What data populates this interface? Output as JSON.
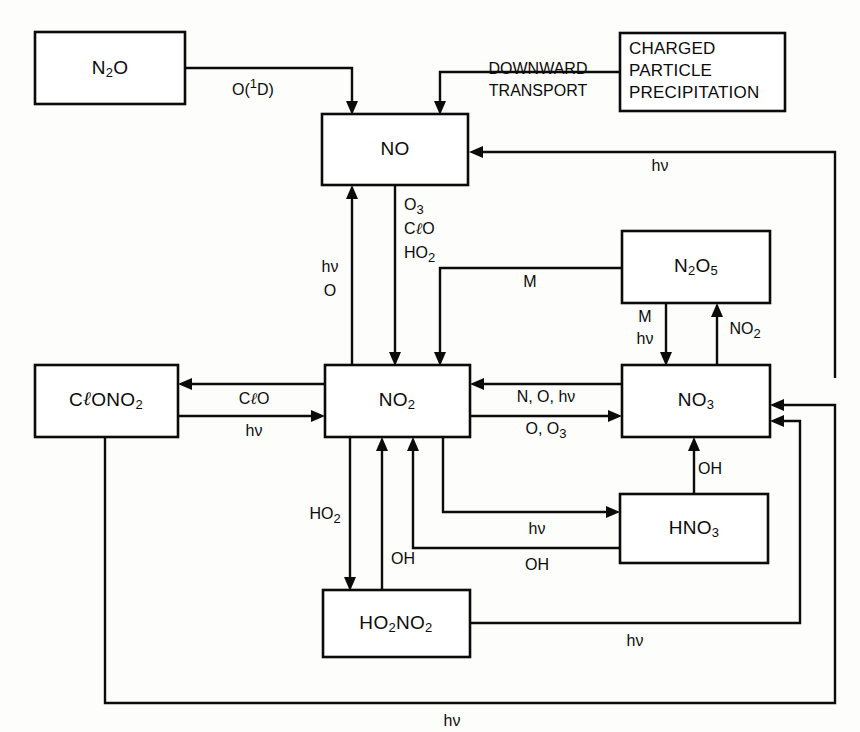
{
  "figure": {
    "background_color": "#fdfdfb",
    "line_color": "#0b0b0b"
  },
  "boxes": [
    {
      "id": "n2o",
      "label": "N2O",
      "display": [
        "N",
        "2",
        "O"
      ],
      "x": 35,
      "y": 32,
      "w": 150,
      "h": 72
    },
    {
      "id": "cpp",
      "label": "CHARGED PARTICLE PRECIPITATION",
      "lines": [
        "CHARGED",
        "PARTICLE",
        "PRECIPITATION"
      ],
      "x": 620,
      "y": 33,
      "w": 165,
      "h": 78
    },
    {
      "id": "no",
      "label": "NO",
      "display": [
        "NO"
      ],
      "x": 322,
      "y": 114,
      "w": 146,
      "h": 71
    },
    {
      "id": "n2o5",
      "label": "N2O5",
      "display": [
        "N",
        "2",
        "O",
        "5"
      ],
      "x": 622,
      "y": 231,
      "w": 148,
      "h": 72
    },
    {
      "id": "clono2",
      "label": "CℓONO2",
      "display": [
        "Cℓ",
        "ONO",
        "2"
      ],
      "x": 35,
      "y": 365,
      "w": 143,
      "h": 72
    },
    {
      "id": "no2",
      "label": "NO2",
      "display": [
        "NO",
        "2"
      ],
      "x": 325,
      "y": 365,
      "w": 145,
      "h": 72
    },
    {
      "id": "no3",
      "label": "NO3",
      "display": [
        "NO",
        "3"
      ],
      "x": 622,
      "y": 365,
      "w": 148,
      "h": 72
    },
    {
      "id": "hno3",
      "label": "HNO3",
      "display": [
        "HNO",
        "3"
      ],
      "x": 620,
      "y": 494,
      "w": 148,
      "h": 69
    },
    {
      "id": "ho2no2",
      "label": "HO2NO2",
      "display": [
        "HO",
        "2",
        "NO",
        "2"
      ],
      "x": 323,
      "y": 590,
      "w": 147,
      "h": 67
    }
  ],
  "edge_labels": {
    "o1d": "O(1D)",
    "downward_transport_line1": "DOWNWARD",
    "downward_transport_line2": "TRANSPORT",
    "hv_no_right": "hν",
    "o3": "O3",
    "clo_mid": "CℓO",
    "ho2_mid": "HO2",
    "hv_left": "hν",
    "o_left": "O",
    "m_n2o5": "M",
    "m_down": "M",
    "hv_down": "hν",
    "no2_up": "NO2",
    "clo_left": "CℓO",
    "hv_clono2": "hν",
    "n_o_hv": "N, O, hν",
    "o_o3": "O, O3",
    "ho2_lower": "HO2",
    "oh_ho2no2": "OH",
    "hv_hno3": "hν",
    "oh_hno3": "OH",
    "oh_no3": "OH",
    "hv_ho2no2_right": "hν",
    "hv_bottom": "hν"
  },
  "species": [
    "N2O",
    "NO",
    "NO2",
    "NO3",
    "N2O5",
    "HNO3",
    "HO2NO2",
    "CℓONO2"
  ],
  "sources": [
    "CHARGED PARTICLE PRECIPITATION",
    "DOWNWARD TRANSPORT",
    "O(1D) + N2O"
  ],
  "reactions": [
    {
      "from": "N2O",
      "to": "NO",
      "label": "O(1D)"
    },
    {
      "from": "CHARGED PARTICLE PRECIPITATION",
      "to": "NO",
      "label": "DOWNWARD TRANSPORT"
    },
    {
      "from": "NO3",
      "to": "NO",
      "label": "hν"
    },
    {
      "from": "NO",
      "to": "NO2",
      "label": "O3, CℓO, HO2"
    },
    {
      "from": "NO2",
      "to": "NO",
      "label": "hν, O"
    },
    {
      "from": "N2O5",
      "to": "NO2",
      "label": "M"
    },
    {
      "from": "N2O5",
      "to": "NO3",
      "label": "M, hν"
    },
    {
      "from": "NO3",
      "to": "N2O5",
      "label": "NO2"
    },
    {
      "from": "NO2",
      "to": "CℓONO2",
      "label": "CℓO"
    },
    {
      "from": "CℓONO2",
      "to": "NO2",
      "label": "hν"
    },
    {
      "from": "NO3",
      "to": "NO2",
      "label": "N, O, hν"
    },
    {
      "from": "NO2",
      "to": "NO3",
      "label": "O, O3"
    },
    {
      "from": "NO2",
      "to": "HO2NO2",
      "label": "HO2"
    },
    {
      "from": "HO2NO2",
      "to": "NO2",
      "label": "OH"
    },
    {
      "from": "NO2",
      "to": "HNO3",
      "label": "hν"
    },
    {
      "from": "HNO3",
      "to": "NO2",
      "label": "OH"
    },
    {
      "from": "HNO3",
      "to": "NO3",
      "label": "OH"
    },
    {
      "from": "HO2NO2",
      "to": "NO3",
      "label": "hν"
    },
    {
      "from": "CℓONO2",
      "to": "NO3",
      "label": "hν"
    }
  ]
}
